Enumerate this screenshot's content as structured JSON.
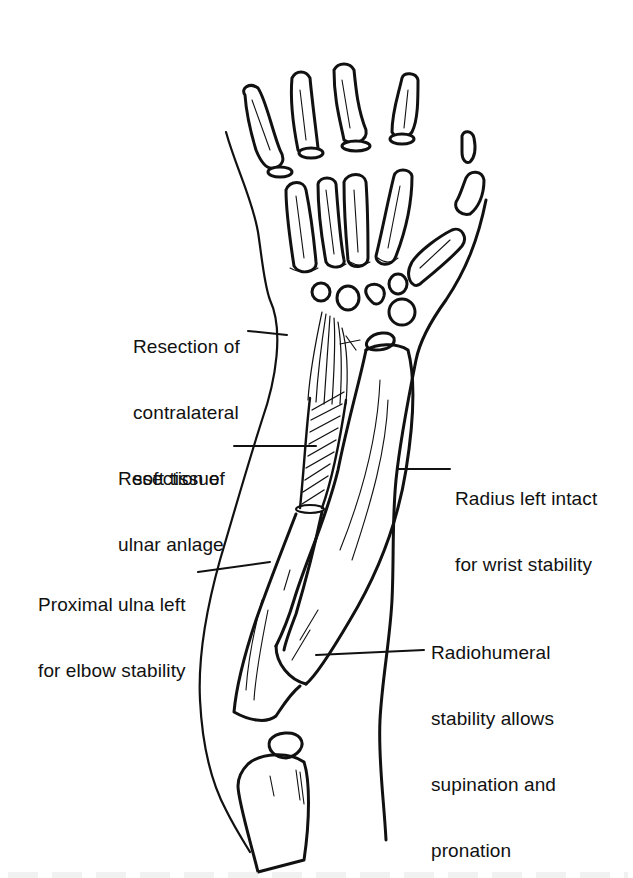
{
  "figure": {
    "stroke_color": "#111111",
    "background_color": "#ffffff"
  },
  "labels": [
    {
      "id": "contralateral",
      "lines": [
        "Resection of",
        "contralateral",
        "soft tissue"
      ]
    },
    {
      "id": "ulnar-anlage",
      "lines": [
        "Resection of",
        "ulnar anlage"
      ]
    },
    {
      "id": "radius",
      "lines": [
        "Radius left intact",
        "for wrist stability"
      ]
    },
    {
      "id": "proximal-ulna",
      "lines": [
        "Proximal ulna left",
        "for elbow stability"
      ]
    },
    {
      "id": "radiohumeral",
      "lines": [
        "Radiohumeral",
        "stability allows",
        "supination and",
        "pronation"
      ]
    }
  ]
}
